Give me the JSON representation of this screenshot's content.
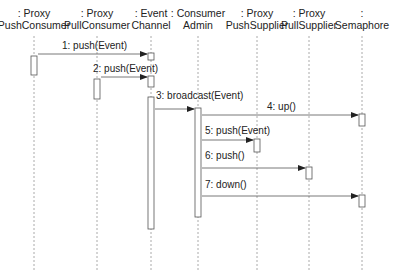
{
  "diagram": {
    "type": "uml-sequence",
    "lifelines": [
      {
        "id": "pushconsumer",
        "line1": ": Proxy",
        "line2": "PushConsumer",
        "x": 34
      },
      {
        "id": "pullconsumer",
        "line1": ": Proxy",
        "line2": "PullConsumer",
        "x": 97
      },
      {
        "id": "eventchannel",
        "line1": ": Event",
        "line2": "Channel",
        "x": 151
      },
      {
        "id": "consumeradmin",
        "line1": ": Consumer",
        "line2": "Admin",
        "x": 198
      },
      {
        "id": "pushsupplier",
        "line1": ": Proxy",
        "line2": "PushSupplier",
        "x": 257
      },
      {
        "id": "pullsupplier",
        "line1": ": Proxy",
        "line2": "PullSupplier",
        "x": 309
      },
      {
        "id": "semaphore",
        "line1": ":",
        "line2": "Semaphore",
        "x": 362
      }
    ],
    "messages": [
      {
        "label": "1: push(Event)",
        "from": "pushconsumer",
        "to": "eventchannel",
        "y": 54,
        "label_x": 62,
        "label_y": 40
      },
      {
        "label": "2: push(Event)",
        "from": "pullconsumer",
        "to": "eventchannel",
        "y": 77,
        "label_x": 93,
        "label_y": 63
      },
      {
        "label": "3: broadcast(Event)",
        "from": "eventchannel",
        "to": "consumeradmin",
        "y": 109,
        "label_x": 156,
        "label_y": 90
      },
      {
        "label": "4: up()",
        "from": "consumeradmin",
        "to": "semaphore",
        "y": 115,
        "label_x": 267,
        "label_y": 101
      },
      {
        "label": "5: push(Event)",
        "from": "consumeradmin",
        "to": "pushsupplier",
        "y": 140,
        "label_x": 205,
        "label_y": 125
      },
      {
        "label": "6: push()",
        "from": "consumeradmin",
        "to": "pullsupplier",
        "y": 168,
        "label_x": 205,
        "label_y": 150
      },
      {
        "label": "7: down()",
        "from": "consumeradmin",
        "to": "semaphore",
        "y": 196,
        "label_x": 205,
        "label_y": 179
      }
    ],
    "activations": [
      {
        "lifeline": "pushconsumer",
        "y1": 56,
        "y2": 75
      },
      {
        "lifeline": "pullconsumer",
        "y1": 79,
        "y2": 99
      },
      {
        "lifeline": "eventchannel",
        "y1": 53,
        "y2": 60
      },
      {
        "lifeline": "eventchannel",
        "y1": 76,
        "y2": 87
      },
      {
        "lifeline": "eventchannel",
        "y1": 97,
        "y2": 229
      },
      {
        "lifeline": "consumeradmin",
        "y1": 108,
        "y2": 217
      },
      {
        "lifeline": "pushsupplier",
        "y1": 139,
        "y2": 152
      },
      {
        "lifeline": "pullsupplier",
        "y1": 167,
        "y2": 179
      },
      {
        "lifeline": "semaphore",
        "y1": 114,
        "y2": 126
      },
      {
        "lifeline": "semaphore",
        "y1": 195,
        "y2": 207
      }
    ],
    "colors": {
      "line": "#555555",
      "lifeline": "#aaaaaa",
      "activation_fill": "#ffffff"
    }
  }
}
